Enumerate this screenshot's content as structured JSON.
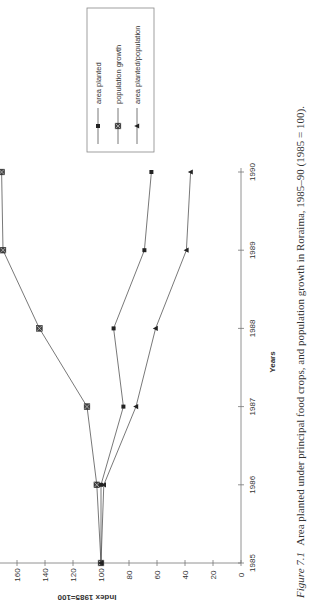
{
  "chart_data": {
    "type": "line",
    "title": "",
    "xlabel": "Years",
    "ylabel": "Index 1985=100",
    "categories": [
      "1985",
      "1986",
      "1987",
      "1988",
      "1989",
      "1990"
    ],
    "x": [
      1985,
      1986,
      1987,
      1988,
      1989,
      1990
    ],
    "series": [
      {
        "name": "area planted",
        "marker": "square-small",
        "values": [
          100,
          100,
          84,
          91,
          69,
          64
        ]
      },
      {
        "name": "population growth",
        "marker": "square-x",
        "values": [
          100,
          103,
          110,
          144,
          170,
          171
        ]
      },
      {
        "name": "area planted/population",
        "marker": "triangle",
        "values": [
          100,
          98,
          75,
          61,
          39,
          36
        ]
      }
    ],
    "ylim": [
      0,
      170
    ],
    "yticks": [
      0,
      20,
      40,
      60,
      80,
      100,
      120,
      140,
      160
    ],
    "grid": false,
    "legend_position": "upper right (rotated)",
    "orientation": "rotated 90 degrees counter-clockwise on page"
  },
  "caption": {
    "label": "Figure 7.1",
    "text": "Area planted under principal food crops, and population growth in Roraima, 1985–90 (1985 = 100)."
  },
  "colors": {
    "line": "#555555",
    "marker": "#222222",
    "axis": "#777777",
    "text": "#333333"
  }
}
